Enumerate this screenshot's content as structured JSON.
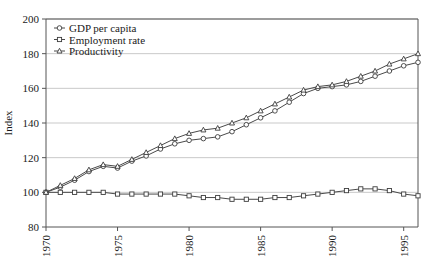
{
  "chart_data": {
    "type": "line",
    "title": "",
    "xlabel": "",
    "ylabel": "Index",
    "xlim": [
      1970,
      1996
    ],
    "ylim": [
      80,
      200
    ],
    "yticks": [
      80,
      100,
      120,
      140,
      160,
      180,
      200
    ],
    "xticks": [
      1970,
      1975,
      1980,
      1985,
      1990,
      1995
    ],
    "xtick_labels": [
      "1970",
      "1975",
      "1980",
      "1985",
      "1990",
      "1995"
    ],
    "ytick_labels": [
      "80",
      "100",
      "120",
      "140",
      "160",
      "180",
      "200"
    ],
    "grid": "horizontal",
    "legend_position": "top-left",
    "x": [
      1970,
      1971,
      1972,
      1973,
      1974,
      1975,
      1976,
      1977,
      1978,
      1979,
      1980,
      1981,
      1982,
      1983,
      1984,
      1985,
      1986,
      1987,
      1988,
      1989,
      1990,
      1991,
      1992,
      1993,
      1994,
      1995,
      1996
    ],
    "series": [
      {
        "name": "GDP per capita",
        "marker": "circle",
        "color": "#4a4a4a",
        "values": [
          100,
          103,
          107,
          112,
          115,
          114,
          118,
          121,
          125,
          128,
          130,
          131,
          132,
          135,
          139,
          143,
          147,
          152,
          157,
          160,
          161,
          162,
          164,
          167,
          170,
          173,
          175
        ]
      },
      {
        "name": "Employment rate",
        "marker": "square",
        "color": "#4a4a4a",
        "values": [
          100,
          100,
          100,
          100,
          100,
          99,
          99,
          99,
          99,
          99,
          98,
          97,
          97,
          96,
          96,
          96,
          97,
          97,
          98,
          99,
          100,
          101,
          102,
          102,
          101,
          99,
          98
        ]
      },
      {
        "name": "Productivity",
        "marker": "triangle",
        "color": "#4a4a4a",
        "values": [
          100,
          104,
          108,
          113,
          116,
          115,
          119,
          123,
          127,
          131,
          134,
          136,
          137,
          140,
          143,
          147,
          151,
          155,
          159,
          161,
          162,
          164,
          167,
          170,
          174,
          177,
          180
        ]
      }
    ]
  },
  "legend": {
    "entries": [
      {
        "label": "GDP per capita"
      },
      {
        "label": "Employment rate"
      },
      {
        "label": "Productivity"
      }
    ]
  }
}
